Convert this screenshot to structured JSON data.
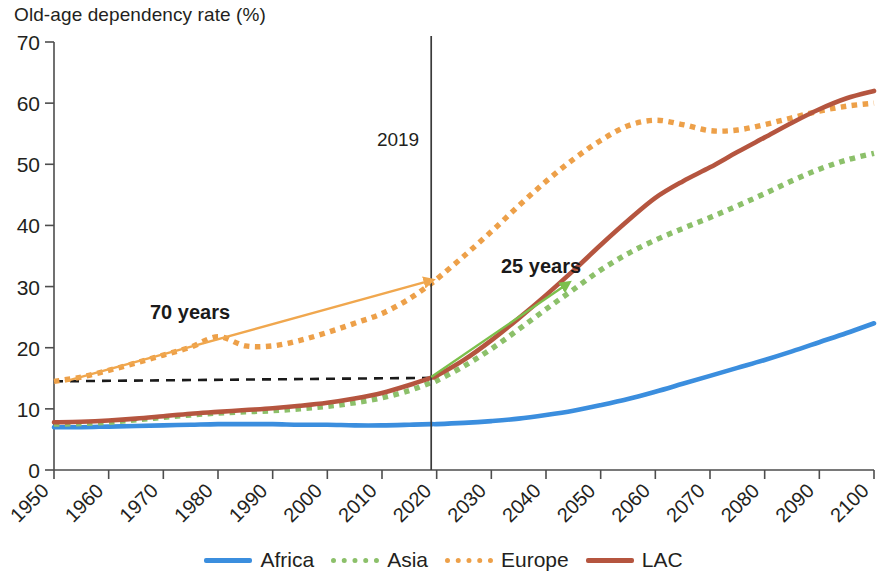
{
  "title": "Old-age dependency rate (%)",
  "axes": {
    "y_ticks": [
      "0",
      "10",
      "20",
      "30",
      "40",
      "50",
      "60",
      "70"
    ],
    "x_ticks": [
      "1950",
      "1960",
      "1970",
      "1980",
      "1990",
      "2000",
      "2010",
      "2020",
      "2030",
      "2040",
      "2050",
      "2060",
      "2070",
      "2080",
      "2090",
      "2100"
    ]
  },
  "annotations": {
    "year_marker": "2019",
    "arrow_left": "70 years",
    "arrow_right": "25 years"
  },
  "legend": {
    "items": [
      {
        "label": "Africa",
        "color": "#3b8ede",
        "style": "solid"
      },
      {
        "label": "Asia",
        "color": "#8cc06a",
        "style": "dotted"
      },
      {
        "label": "Europe",
        "color": "#eda049",
        "style": "dotted"
      },
      {
        "label": "LAC",
        "color": "#b5553f",
        "style": "solid"
      }
    ]
  },
  "chart_data": {
    "type": "line",
    "title": "Old-age dependency rate (%)",
    "xlabel": "",
    "ylabel": "Old-age dependency rate (%)",
    "xlim": [
      1950,
      2100
    ],
    "ylim": [
      0,
      70
    ],
    "grid": false,
    "legend_position": "bottom",
    "x": [
      1950,
      1955,
      1960,
      1965,
      1970,
      1975,
      1980,
      1985,
      1990,
      1995,
      2000,
      2005,
      2010,
      2015,
      2019,
      2020,
      2025,
      2030,
      2035,
      2040,
      2045,
      2050,
      2055,
      2060,
      2065,
      2070,
      2075,
      2080,
      2085,
      2090,
      2095,
      2100
    ],
    "series": [
      {
        "name": "Africa",
        "color": "#3b8ede",
        "style": "solid",
        "values": [
          7.0,
          7.0,
          7.1,
          7.2,
          7.3,
          7.4,
          7.5,
          7.5,
          7.5,
          7.4,
          7.4,
          7.3,
          7.3,
          7.4,
          7.5,
          7.5,
          7.7,
          8.0,
          8.4,
          9.0,
          9.7,
          10.6,
          11.6,
          12.8,
          14.1,
          15.4,
          16.7,
          18.0,
          19.4,
          20.9,
          22.4,
          24.0
        ]
      },
      {
        "name": "Asia",
        "color": "#8cc06a",
        "style": "dotted",
        "values": [
          7.5,
          7.6,
          7.8,
          8.2,
          8.6,
          9.0,
          9.3,
          9.5,
          9.7,
          10.0,
          10.4,
          11.0,
          11.8,
          13.0,
          14.3,
          14.6,
          17.0,
          19.8,
          23.0,
          26.3,
          29.5,
          32.7,
          35.4,
          37.6,
          39.5,
          41.3,
          43.2,
          45.2,
          47.3,
          49.2,
          50.7,
          51.8
        ]
      },
      {
        "name": "Europe",
        "color": "#eda049",
        "style": "dotted",
        "values": [
          14.5,
          15.2,
          16.3,
          17.5,
          18.8,
          20.1,
          21.8,
          20.3,
          20.3,
          21.2,
          22.5,
          24.0,
          25.6,
          28.0,
          30.5,
          31.2,
          35.0,
          39.0,
          43.2,
          47.2,
          50.8,
          53.9,
          56.3,
          57.2,
          56.5,
          55.5,
          55.6,
          56.5,
          57.6,
          58.7,
          59.5,
          60.0
        ]
      },
      {
        "name": "LAC",
        "color": "#b5553f",
        "style": "solid",
        "values": [
          7.8,
          7.9,
          8.1,
          8.4,
          8.8,
          9.2,
          9.5,
          9.8,
          10.1,
          10.5,
          11.0,
          11.7,
          12.6,
          13.9,
          15.1,
          15.4,
          18.0,
          21.2,
          24.8,
          28.6,
          32.6,
          36.8,
          40.8,
          44.5,
          47.2,
          49.5,
          52.0,
          54.4,
          56.8,
          59.0,
          60.8,
          62.0
        ]
      }
    ],
    "reference_line": {
      "value": 14.5,
      "from_year": 1950,
      "to_year": 2019,
      "style": "dashed",
      "color": "#1a1a1a"
    },
    "vertical_marker": {
      "year": 2019,
      "label": "2019"
    },
    "callouts": [
      {
        "label": "70 years",
        "from_year": 1952,
        "from_value": 14.5,
        "to_year": 2019,
        "to_value": 31.0,
        "color": "#f0a74e"
      },
      {
        "label": "25 years",
        "from_year": 2019,
        "from_value": 15.2,
        "to_year": 2044,
        "to_value": 30.5,
        "color": "#7cc04c"
      }
    ]
  }
}
